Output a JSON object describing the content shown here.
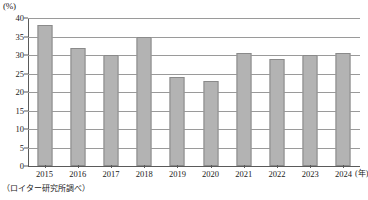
{
  "chart_data": {
    "type": "bar",
    "title": "",
    "subtitle": "",
    "xlabel": "年",
    "ylabel": "(%)",
    "unit_label_y": "(%)",
    "unit_label_x": "(年)",
    "categories": [
      "2015",
      "2016",
      "2017",
      "2018",
      "2019",
      "2020",
      "2021",
      "2022",
      "2023",
      "2024"
    ],
    "values": [
      38,
      32,
      30,
      35,
      24,
      23,
      30.5,
      29,
      30,
      30.5
    ],
    "series": [
      {
        "name": "割合",
        "values": [
          38,
          32,
          30,
          35,
          24,
          23,
          30.5,
          29,
          30,
          30.5
        ]
      }
    ],
    "ylim": [
      0,
      40
    ],
    "ytick_values": [
      0,
      5,
      10,
      15,
      20,
      25,
      30,
      35,
      40
    ],
    "ytick_labels": [
      "0",
      "5",
      "10",
      "15",
      "20",
      "25",
      "30",
      "35",
      "40"
    ],
    "grid": true,
    "grid_axis": "y",
    "legend": false,
    "legend_position": "none",
    "bar_color": "#b3b3b3",
    "bar_border_color": "#8a8a8a",
    "grid_color": "#9a9a9a",
    "axis_color": "#5a5a5a",
    "background_color": "#ffffff",
    "annotation": "（ロイター研究所調べ）"
  },
  "caption": {
    "source_note": "（ロイター研究所調べ）"
  }
}
